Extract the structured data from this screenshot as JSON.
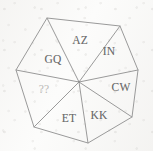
{
  "diagram": {
    "shape": "heptagon",
    "sector_count": 7,
    "stroke_color": "#9a9a9a",
    "label_color": "#6b6b6b",
    "faded_label_color": "#b9b8b6",
    "background_color": "#fbfbfa",
    "center": {
      "x": 79,
      "y": 82
    },
    "vertices": [
      {
        "name": "vertex-top-left",
        "x": 47,
        "y": 18
      },
      {
        "name": "vertex-top-right",
        "x": 120,
        "y": 26
      },
      {
        "name": "vertex-right",
        "x": 138,
        "y": 70
      },
      {
        "name": "vertex-bottom-right",
        "x": 132,
        "y": 117
      },
      {
        "name": "vertex-bottom",
        "x": 88,
        "y": 143
      },
      {
        "name": "vertex-bottom-left",
        "x": 34,
        "y": 127
      },
      {
        "name": "vertex-left",
        "x": 16,
        "y": 70
      }
    ],
    "sectors": [
      {
        "id": "sector-az",
        "label": "AZ",
        "label_x": 80,
        "label_y": 41,
        "faded": false
      },
      {
        "id": "sector-in",
        "label": "IN",
        "label_x": 109,
        "label_y": 52,
        "faded": false
      },
      {
        "id": "sector-cw",
        "label": "CW",
        "label_x": 121,
        "label_y": 88,
        "faded": false
      },
      {
        "id": "sector-kk",
        "label": "KK",
        "label_x": 99,
        "label_y": 116,
        "faded": false
      },
      {
        "id": "sector-et",
        "label": "ET",
        "label_x": 69,
        "label_y": 119,
        "faded": false
      },
      {
        "id": "sector-qq",
        "label": "??",
        "label_x": 44,
        "label_y": 90,
        "faded": true
      },
      {
        "id": "sector-gq",
        "label": "GQ",
        "label_x": 53,
        "label_y": 60,
        "faded": false
      }
    ]
  }
}
